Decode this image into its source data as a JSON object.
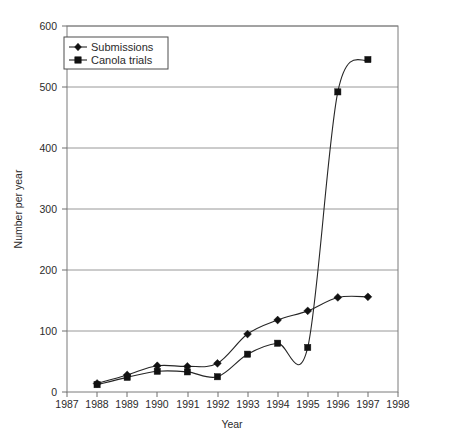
{
  "chart_data": {
    "type": "line",
    "title": "",
    "xlabel": "Year",
    "ylabel": "Number per year",
    "x": [
      1988,
      1989,
      1990,
      1991,
      1992,
      1993,
      1994,
      1995,
      1996,
      1997
    ],
    "xlim": [
      1987,
      1998
    ],
    "ylim": [
      0,
      600
    ],
    "xticks": [
      1987,
      1988,
      1989,
      1990,
      1991,
      1992,
      1993,
      1994,
      1995,
      1996,
      1997,
      1998
    ],
    "yticks": [
      0,
      100,
      200,
      300,
      400,
      500,
      600
    ],
    "xticklabels": [
      "1987",
      "1988",
      "1989",
      "1990",
      "1991",
      "1992",
      "1993",
      "1994",
      "1995",
      "1996",
      "1997",
      "1998"
    ],
    "yticklabels": [
      "0",
      "100",
      "200",
      "300",
      "400",
      "500",
      "600"
    ],
    "grid": "horizontal",
    "legend_position": "top-left",
    "series": [
      {
        "name": "Submissions",
        "marker": "diamond",
        "color": "#111111",
        "values": [
          14,
          28,
          43,
          42,
          47,
          95,
          118,
          133,
          155,
          156
        ]
      },
      {
        "name": "Canola trials",
        "marker": "square",
        "color": "#111111",
        "values": [
          12,
          24,
          34,
          33,
          25,
          62,
          80,
          73,
          492,
          545
        ]
      }
    ]
  },
  "legend": {
    "entries": [
      {
        "label": "Submissions",
        "marker": "diamond-marker"
      },
      {
        "label": "Canola trials",
        "marker": "square-marker"
      }
    ]
  },
  "axes": {
    "x_title": "Year",
    "y_title": "Number per year"
  }
}
